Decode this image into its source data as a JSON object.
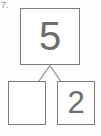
{
  "worksheet": {
    "problem_number": "7.",
    "type": "number-bond",
    "whole": {
      "value": "5",
      "filled": true
    },
    "parts": [
      {
        "value": "",
        "filled": false,
        "position": "left"
      },
      {
        "value": "2",
        "filled": true,
        "position": "right"
      }
    ],
    "colors": {
      "border": "#7a7a7a",
      "digit": "#6e6e6e",
      "connector": "#8a8a8a",
      "background": "#fefefe",
      "label": "#8d8d8d"
    },
    "connectors": [
      {
        "from": "whole-bottom-center",
        "to": "left-part-top-right"
      },
      {
        "from": "whole-bottom-center",
        "to": "right-part-top-left"
      }
    ]
  }
}
